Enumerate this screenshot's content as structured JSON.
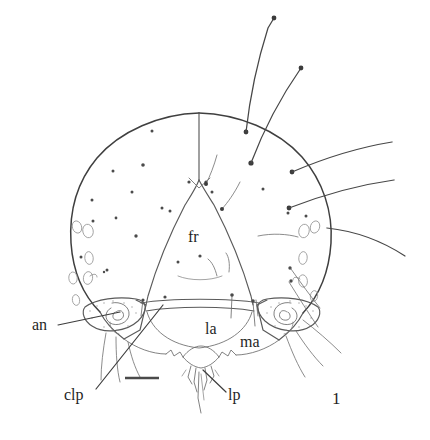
{
  "figure": {
    "number": "1",
    "background_color": "#ffffff",
    "ink_color": "#4a4a4a",
    "width": 430,
    "height": 440
  },
  "labels": [
    {
      "id": "an",
      "text": "an",
      "x": 32,
      "y": 330,
      "meaning": "antenna"
    },
    {
      "id": "fr",
      "text": "fr",
      "x": 188,
      "y": 242,
      "meaning": "frons"
    },
    {
      "id": "la",
      "text": "la",
      "x": 205,
      "y": 334,
      "meaning": "labrum"
    },
    {
      "id": "ma",
      "text": "ma",
      "x": 240,
      "y": 347,
      "meaning": "mandible"
    },
    {
      "id": "clp",
      "text": "clp",
      "x": 64,
      "y": 400,
      "meaning": "clypeus"
    },
    {
      "id": "lp",
      "text": "lp",
      "x": 228,
      "y": 400,
      "meaning": "labial palp"
    }
  ],
  "figure_number": {
    "text": "1",
    "x": 332,
    "y": 404
  },
  "scale_bar": {
    "x1": 125,
    "x2": 159,
    "y": 378,
    "label": ""
  },
  "leaders": [
    {
      "for": "an",
      "path": "M 58 325 L 120 312"
    },
    {
      "for": "clp",
      "path": "M 96 389 L 163 305"
    },
    {
      "for": "lp",
      "path": "M 226 392 L 203 370"
    }
  ],
  "anatomy": {
    "head_outline": "roughly circular head capsule",
    "frons": "inverted triangular frontal sclerite",
    "coronal_suture": "median line from vertex to frons apex",
    "antennae": "paired whorled antennal bases on lateral lobes",
    "mouthparts": "labrum, mandibles, labial palps below",
    "stemmata": "small oval pores on lateral margins",
    "setae_count_dorsal": 2,
    "setae_count_lateral_right": 3
  }
}
